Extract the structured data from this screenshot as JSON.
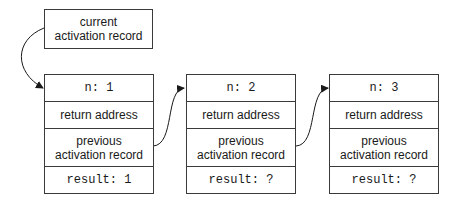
{
  "current_record": {
    "label": "current activation record"
  },
  "records": [
    {
      "n": "n: 1",
      "return": "return address",
      "previous": "previous activation record",
      "result": "result: 1"
    },
    {
      "n": "n: 2",
      "return": "return address",
      "previous": "previous activation record",
      "result": "result: ?"
    },
    {
      "n": "n: 3",
      "return": "return address",
      "previous": "previous activation record",
      "result": "result: ?"
    }
  ]
}
